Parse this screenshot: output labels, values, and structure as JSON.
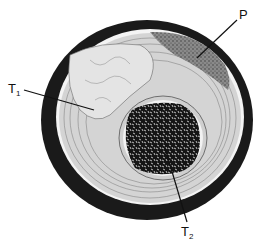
{
  "figure": {
    "labels": [
      {
        "id": "T1",
        "main": "T",
        "sub": "1"
      },
      {
        "id": "P",
        "main": "P",
        "sub": ""
      },
      {
        "id": "T2",
        "main": "T",
        "sub": "2"
      }
    ],
    "colors": {
      "outer_ring": "#1a1a1a",
      "fibrous_layer": "#d8d8d8",
      "T1_region": "#e6e6e6",
      "P_region": "#7a7a7a",
      "T2_region": "#151515",
      "background": "#ffffff"
    }
  }
}
